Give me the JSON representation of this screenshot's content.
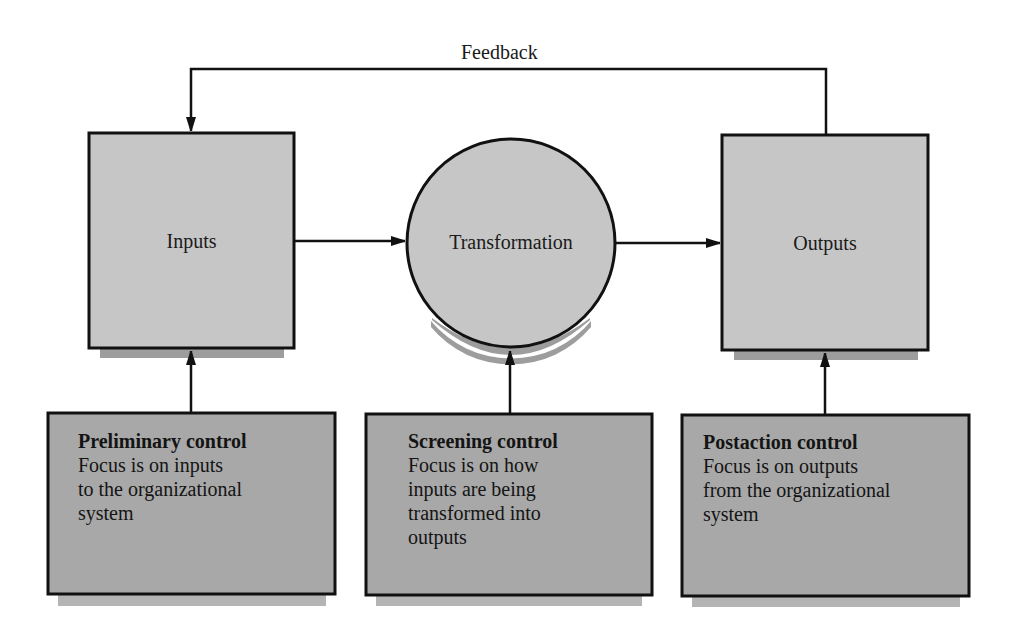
{
  "diagram": {
    "feedback": {
      "label": "Feedback"
    },
    "nodes": {
      "inputs": {
        "label": "Inputs",
        "shape": "rectangle"
      },
      "transformation": {
        "label": "Transformation",
        "shape": "circle"
      },
      "outputs": {
        "label": "Outputs",
        "shape": "rectangle"
      }
    },
    "controls": [
      {
        "title": "Preliminary control",
        "lines": [
          "Focus is on inputs",
          "to the organizational",
          "system"
        ],
        "targets": "inputs"
      },
      {
        "title": "Screening control",
        "lines": [
          "Focus is on how",
          "inputs are being",
          "transformed into",
          "outputs"
        ],
        "targets": "transformation"
      },
      {
        "title": "Postaction control",
        "lines": [
          "Focus is on outputs",
          "from the organizational",
          "system"
        ],
        "targets": "outputs"
      }
    ],
    "edges": [
      {
        "from": "inputs",
        "to": "transformation"
      },
      {
        "from": "transformation",
        "to": "outputs"
      },
      {
        "from": "outputs",
        "to": "inputs",
        "label": "Feedback"
      },
      {
        "from": "Preliminary control",
        "to": "inputs"
      },
      {
        "from": "Screening control",
        "to": "transformation"
      },
      {
        "from": "Postaction control",
        "to": "outputs"
      }
    ],
    "colors": {
      "node_fill": "#c6c6c6",
      "control_fill": "#a8a8a8",
      "shadow": "#9a9a9a",
      "control_shadow": "#b4b4b4",
      "stroke": "#111111"
    }
  }
}
